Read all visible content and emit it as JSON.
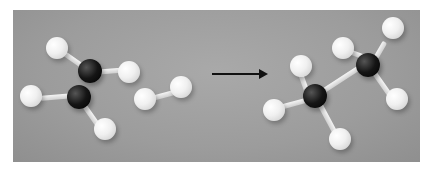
{
  "figure": {
    "left_group": {
      "carbon_atoms": 2,
      "hydrogen_atoms": 6
    },
    "right_group": {
      "carbon_atoms": 2,
      "hydrogen_atoms": 6
    },
    "arrow": "right-arrow",
    "colors": {
      "background": "#9c9c9c",
      "carbon": "#111111",
      "hydrogen": "#f0f0f0",
      "arrow": "#111111"
    }
  }
}
